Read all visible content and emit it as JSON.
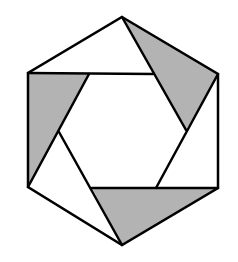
{
  "figure": {
    "colors": {
      "background": "#ffffff",
      "stroke": "#000000",
      "shade": "#b3b3b3"
    },
    "outer_hexagon": [
      [
        122,
        17
      ],
      [
        218,
        74
      ],
      [
        218,
        188
      ],
      [
        122,
        245
      ],
      [
        28,
        187
      ],
      [
        28,
        73
      ]
    ],
    "shaded_triangles": [
      [
        [
          28,
          73
        ],
        [
          89,
          74
        ],
        [
          28,
          187
        ]
      ],
      [
        [
          122,
          17
        ],
        [
          218,
          74
        ],
        [
          186,
          130
        ]
      ],
      [
        [
          92,
          188
        ],
        [
          218,
          188
        ],
        [
          122,
          245
        ]
      ]
    ],
    "lines": [
      [
        [
          28,
          73
        ],
        [
          153,
          74
        ]
      ],
      [
        [
          122,
          17
        ],
        [
          186,
          130
        ]
      ],
      [
        [
          218,
          74
        ],
        [
          156,
          188
        ]
      ],
      [
        [
          218,
          188
        ],
        [
          92,
          188
        ]
      ],
      [
        [
          122,
          245
        ],
        [
          59,
          132
        ]
      ],
      [
        [
          28,
          187
        ],
        [
          89,
          74
        ]
      ]
    ]
  }
}
